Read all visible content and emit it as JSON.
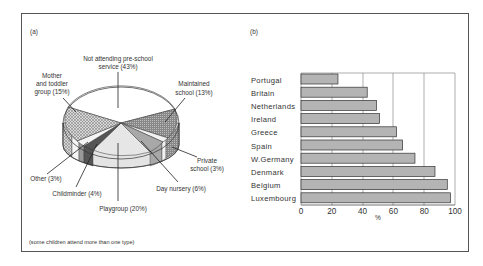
{
  "chart_data": [
    {
      "type": "pie",
      "panel_label": "(a)",
      "title": "",
      "slices": [
        {
          "label": "Not attending pre-school service",
          "value": 43,
          "display": "Not attending pre-school service (43%)"
        },
        {
          "label": "Maintained school",
          "value": 13,
          "display": "Maintained school (13%)"
        },
        {
          "label": "Private school",
          "value": 3,
          "display": "Private school (3%)"
        },
        {
          "label": "Day nursery",
          "value": 6,
          "display": "Day nursery (6%)"
        },
        {
          "label": "Playgroup",
          "value": 20,
          "display": "Playgroup (20%)"
        },
        {
          "label": "Childminder",
          "value": 4,
          "display": "Childminder (4%)"
        },
        {
          "label": "Other",
          "value": 3,
          "display": "Other (3%)"
        },
        {
          "label": "Mother and toddler group",
          "value": 15,
          "display": "Mother and toddler group (15%)"
        }
      ],
      "footnote": "(some children attend more than one type)"
    },
    {
      "type": "bar",
      "orientation": "horizontal",
      "panel_label": "(b)",
      "title": "",
      "categories": [
        "Portugal",
        "Britain",
        "Netherlands",
        "Ireland",
        "Greece",
        "Spain",
        "W.Germany",
        "Denmark",
        "Belgium",
        "Luxembourg"
      ],
      "values": [
        24,
        43,
        49,
        51,
        62,
        66,
        74,
        87,
        95,
        97
      ],
      "xlabel": "%",
      "ylabel": "",
      "xlim": [
        0,
        100
      ],
      "xticks": [
        "0",
        "20",
        "40",
        "60",
        "80",
        "100"
      ],
      "grid": "vertical"
    }
  ],
  "labels": {
    "panel_a": "(a)",
    "panel_b": "(b)",
    "not_attending_1": "Not attending pre-school",
    "not_attending_2": "service (43%)",
    "mother_1": "Mother",
    "mother_2": "and toddler",
    "mother_3": "group (15%)",
    "maintained_1": "Maintained",
    "maintained_2": "school (13%)",
    "private_1": "Private",
    "private_2": "school (3%)",
    "day_nursery": "Day nursery (6%)",
    "playgroup": "Playgroup (20%)",
    "childminder": "Childminder (4%)",
    "other": "Other (3%)",
    "footnote": "(some children attend more than one type)",
    "xlabel": "%"
  },
  "colors": {
    "bar_fill": "#b4b4b4",
    "bar_stroke": "#333333",
    "frame": "#555555",
    "grid": "#777777"
  }
}
